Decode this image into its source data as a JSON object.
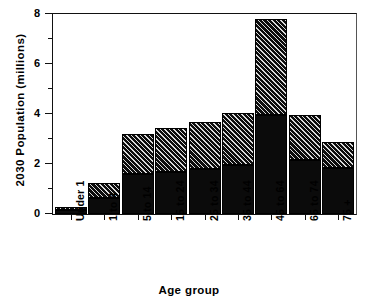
{
  "chart_data": {
    "type": "bar",
    "title": "",
    "subtitle": "",
    "xlabel": "Age group",
    "ylabel": "2030 Population  (millions)",
    "categories": [
      "Under 1",
      "1 to 4",
      "5 to 14",
      "15 to 24",
      "25 to 34",
      "35 to 44",
      "45 to 64",
      "65 to 74",
      "75 +"
    ],
    "stacked": true,
    "series": [
      {
        "name": "lower segment (solid black)",
        "fill": "solid-black",
        "color": "#0b0b0b",
        "values": [
          0.18,
          0.64,
          1.6,
          1.68,
          1.8,
          1.96,
          3.96,
          2.16,
          1.84
        ]
      },
      {
        "name": "upper segment (diagonal hatch)",
        "fill": "diagonal-hatch",
        "color": "#0d0d0d",
        "values": [
          0.12,
          0.6,
          1.6,
          1.76,
          1.88,
          2.08,
          3.84,
          1.8,
          1.04
        ]
      }
    ],
    "totals": [
      0.3,
      1.24,
      3.2,
      3.44,
      3.68,
      4.04,
      7.8,
      3.96,
      2.88
    ],
    "ylim": [
      0,
      8
    ],
    "yticks_major": [
      0,
      2,
      4,
      6,
      8
    ],
    "yticks_minor": [
      1,
      3,
      5,
      7
    ],
    "ytick_labels": [
      "0",
      "2",
      "4",
      "6",
      "8"
    ],
    "grid": false,
    "legend": "none"
  },
  "axes": {
    "y_title": "2030 Population  (millions)",
    "x_title": "Age group"
  }
}
